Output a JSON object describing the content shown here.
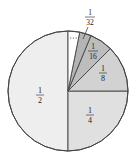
{
  "chart_data": {
    "type": "pie",
    "title": "",
    "center": [
      68,
      91
    ],
    "radius": 60,
    "slices": [
      {
        "label_num": "1",
        "label_den": "2",
        "value": 0.5,
        "start_deg": 90,
        "end_deg": 270,
        "color": "#eeeeee",
        "label_pos": [
          40,
          95
        ]
      },
      {
        "label_num": "1",
        "label_den": "4",
        "value": 0.25,
        "start_deg": 270,
        "end_deg": 360,
        "color": "#e0e0e0",
        "label_pos": [
          90,
          115
        ]
      },
      {
        "label_num": "1",
        "label_den": "8",
        "value": 0.125,
        "start_deg": 0,
        "end_deg": 45,
        "color": "#d2d2d2",
        "label_pos": [
          103,
          73
        ]
      },
      {
        "label_num": "1",
        "label_den": "16",
        "value": 0.0625,
        "start_deg": 45,
        "end_deg": 67.5,
        "color": "#bdbdbd",
        "label_pos": [
          93,
          51
        ]
      },
      {
        "label_num": "1",
        "label_den": "32",
        "value": 0.03125,
        "start_deg": 67.5,
        "end_deg": 78.75,
        "color": "#b4b4b4",
        "label_pos": [
          90,
          17
        ]
      }
    ],
    "remainder": {
      "value": 0.03125,
      "start_deg": 78.75,
      "end_deg": 90,
      "color": "#ffffff",
      "note": "dotted continuation"
    }
  },
  "labels": {
    "half": {
      "num": "1",
      "den": "2"
    },
    "quarter": {
      "num": "1",
      "den": "4"
    },
    "eighth": {
      "num": "1",
      "den": "8"
    },
    "sixteenth": {
      "num": "1",
      "den": "16"
    },
    "thirty_second": {
      "num": "1",
      "den": "32"
    }
  }
}
